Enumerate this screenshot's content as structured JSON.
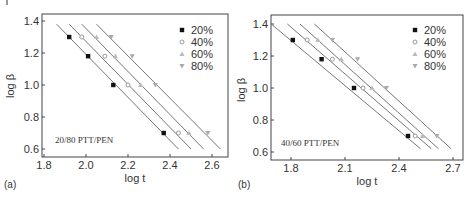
{
  "chart_data": [
    {
      "type": "scatter",
      "panel_label": "(a)",
      "annotation": "20/80 PTT/PEN",
      "title": "",
      "xlabel": "log t",
      "ylabel": "log β",
      "xlim": [
        1.79,
        2.66
      ],
      "ylim": [
        0.56,
        1.45
      ],
      "xticks": [
        "1.8",
        "2.0",
        "2.2",
        "2.4",
        "2.6"
      ],
      "yticks": [
        "0.6",
        "0.8",
        "1.0",
        "1.2",
        "1.4"
      ],
      "grid": false,
      "legend_position": "upper right",
      "fit_lines": true,
      "series": [
        {
          "name": "20%",
          "marker": "filled-square",
          "color": "#111111",
          "x": [
            1.92,
            2.01,
            2.13,
            2.37
          ],
          "y": [
            1.3,
            1.18,
            1.0,
            0.7
          ],
          "line": [
            [
              1.86,
              1.38
            ],
            [
              2.44,
              0.6
            ]
          ]
        },
        {
          "name": "40%",
          "marker": "open-circle",
          "color": "#999999",
          "x": [
            1.98,
            2.09,
            2.2,
            2.44
          ],
          "y": [
            1.3,
            1.18,
            1.0,
            0.7
          ],
          "line": [
            [
              1.92,
              1.38
            ],
            [
              2.5,
              0.6
            ]
          ]
        },
        {
          "name": "60%",
          "marker": "triangle-up",
          "color": "#999999",
          "x": [
            2.05,
            2.14,
            2.26,
            2.49
          ],
          "y": [
            1.3,
            1.18,
            1.0,
            0.7
          ],
          "line": [
            [
              1.98,
              1.38
            ],
            [
              2.56,
              0.6
            ]
          ]
        },
        {
          "name": "80%",
          "marker": "triangle-down",
          "color": "#999999",
          "x": [
            2.12,
            2.22,
            2.33,
            2.58
          ],
          "y": [
            1.3,
            1.18,
            1.0,
            0.7
          ],
          "line": [
            [
              2.05,
              1.38
            ],
            [
              2.64,
              0.6
            ]
          ]
        }
      ]
    },
    {
      "type": "scatter",
      "panel_label": "(b)",
      "annotation": "40/60 PTT/PEN",
      "title": "",
      "xlabel": "log t",
      "ylabel": "log β",
      "xlim": [
        1.69,
        2.75
      ],
      "ylim": [
        0.56,
        1.45
      ],
      "xticks": [
        "1.8",
        "2.1",
        "2.4",
        "2.7"
      ],
      "yticks": [
        "0.6",
        "0.8",
        "1.0",
        "1.2",
        "1.4"
      ],
      "grid": false,
      "legend_position": "upper right",
      "fit_lines": true,
      "series": [
        {
          "name": "20%",
          "marker": "filled-square",
          "color": "#111111",
          "x": [
            1.81,
            1.97,
            2.15,
            2.45
          ],
          "y": [
            1.3,
            1.18,
            1.0,
            0.7
          ],
          "line": [
            [
              1.69,
              1.4
            ],
            [
              2.52,
              0.62
            ]
          ]
        },
        {
          "name": "40%",
          "marker": "open-circle",
          "color": "#999999",
          "x": [
            1.89,
            2.03,
            2.2,
            2.49
          ],
          "y": [
            1.3,
            1.18,
            1.0,
            0.7
          ],
          "line": [
            [
              1.78,
              1.4
            ],
            [
              2.58,
              0.62
            ]
          ]
        },
        {
          "name": "60%",
          "marker": "triangle-up",
          "color": "#999999",
          "x": [
            1.95,
            2.08,
            2.25,
            2.53
          ],
          "y": [
            1.3,
            1.18,
            1.0,
            0.7
          ],
          "line": [
            [
              1.85,
              1.4
            ],
            [
              2.62,
              0.62
            ]
          ]
        },
        {
          "name": "80%",
          "marker": "triangle-down",
          "color": "#999999",
          "x": [
            2.03,
            2.17,
            2.33,
            2.61
          ],
          "y": [
            1.3,
            1.18,
            1.0,
            0.7
          ],
          "line": [
            [
              1.93,
              1.4
            ],
            [
              2.69,
              0.62
            ]
          ]
        }
      ]
    }
  ],
  "panels": [
    {
      "label": "(a)",
      "annotation": "20/80 PTT/PEN",
      "xlabel": "log t",
      "ylabel": "log β"
    },
    {
      "label": "(b)",
      "annotation": "40/60 PTT/PEN",
      "xlabel": "log t",
      "ylabel": "log β"
    }
  ]
}
